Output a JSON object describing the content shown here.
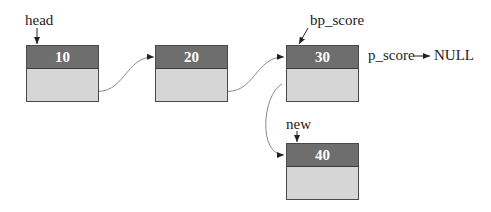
{
  "diagram": {
    "type": "linked-list-insertion",
    "nodes": [
      {
        "id": "n1",
        "value": "10",
        "next": "n2"
      },
      {
        "id": "n2",
        "value": "20",
        "next": "n3"
      },
      {
        "id": "n3",
        "value": "30",
        "next": "n4",
        "old_next_crossed_out": true
      },
      {
        "id": "n4",
        "value": "40",
        "next": null
      }
    ],
    "pointers": {
      "head": "head",
      "bp_score": "bp_score",
      "new": "new",
      "p_score": "p_score",
      "null_label": "NULL"
    },
    "colors": {
      "header_fill": "#6e6e6e",
      "body_fill": "#d6d6d6",
      "header_text": "#ffffff",
      "border": "#4a4a4a"
    }
  }
}
